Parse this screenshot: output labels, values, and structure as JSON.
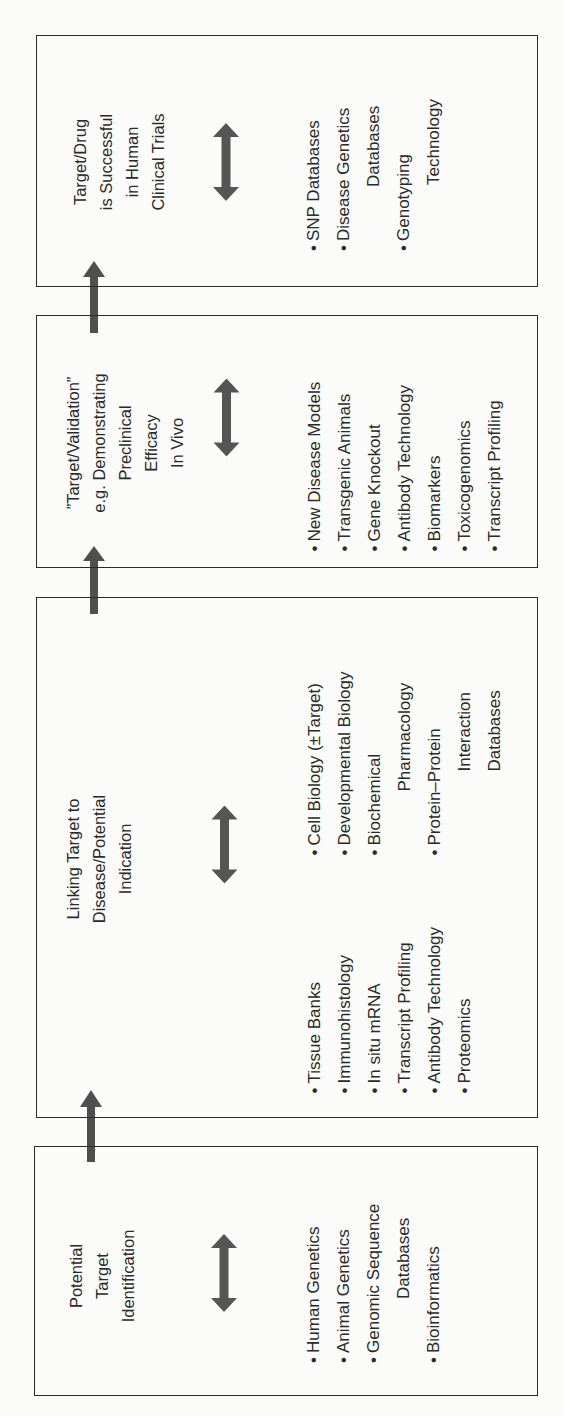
{
  "diagram": {
    "orientation": "rotated-90-ccw",
    "colors": {
      "border": "#2b2b2b",
      "arrow": "#4f4f4f",
      "text": "#2a2a2a",
      "background": "#fbfbf9"
    },
    "stages": [
      {
        "id": "stage-1",
        "title_lines": [
          "Potential",
          "Target",
          "Identification"
        ],
        "items": [
          {
            "bullet": "•",
            "text": "Human Genetics"
          },
          {
            "bullet": "•",
            "text": "Animal Genetics"
          },
          {
            "bullet": "•",
            "text": "Genomic Sequence"
          },
          {
            "bullet": "",
            "text": "Databases",
            "continuation": true
          },
          {
            "bullet": "•",
            "text": "Bioinformatics"
          }
        ]
      },
      {
        "id": "stage-2",
        "title_lines": [
          "Linking Target to",
          "Disease/Potential",
          "Indication"
        ],
        "items_left": [
          {
            "bullet": "•",
            "text": "Tissue Banks"
          },
          {
            "bullet": "•",
            "text": "Immunohistology"
          },
          {
            "bullet": "•",
            "text": "In situ mRNA"
          },
          {
            "bullet": "•",
            "text": "Transcript Profiling"
          },
          {
            "bullet": "•",
            "text": "Antibody Technology"
          },
          {
            "bullet": "•",
            "text": "Proteomics"
          }
        ],
        "items_right": [
          {
            "bullet": "•",
            "text": "Cell Biology (±Target)"
          },
          {
            "bullet": "•",
            "text": "Developmental Biology"
          },
          {
            "bullet": "•",
            "text": "Biochemical"
          },
          {
            "bullet": "",
            "text": "Pharmacology",
            "continuation": true
          },
          {
            "bullet": "•",
            "text": "Protein–Protein"
          },
          {
            "bullet": "",
            "text": "Interaction",
            "continuation": true
          },
          {
            "bullet": "",
            "text": "Databases",
            "continuation": true
          }
        ]
      },
      {
        "id": "stage-3",
        "title_lines": [
          "”Target/Validation”",
          "e.g. Demonstrating",
          "Preclinical",
          "Efficacy",
          "In Vivo"
        ],
        "items": [
          {
            "bullet": "•",
            "text": "New Disease Models"
          },
          {
            "bullet": "•",
            "text": "Transgenic Animals"
          },
          {
            "bullet": "•",
            "text": "Gene Knockout"
          },
          {
            "bullet": "•",
            "text": "Antibody Technology"
          },
          {
            "bullet": "•",
            "text": "Biomarkers"
          },
          {
            "bullet": "•",
            "text": "Toxicogenomics"
          },
          {
            "bullet": "•",
            "text": "Transcript Profiling"
          }
        ]
      },
      {
        "id": "stage-4",
        "title_lines": [
          "Target/Drug",
          "is Successful",
          "in Human",
          "Clinical Trials"
        ],
        "items": [
          {
            "bullet": "•",
            "text": "SNP Databases"
          },
          {
            "bullet": "•",
            "text": "Disease Genetics"
          },
          {
            "bullet": "",
            "text": "Databases",
            "continuation": true
          },
          {
            "bullet": "•",
            "text": "Genotyping"
          },
          {
            "bullet": "",
            "text": "Technology",
            "continuation": true
          }
        ]
      }
    ],
    "flow": [
      "stage-1",
      "stage-2",
      "stage-3",
      "stage-4"
    ]
  }
}
